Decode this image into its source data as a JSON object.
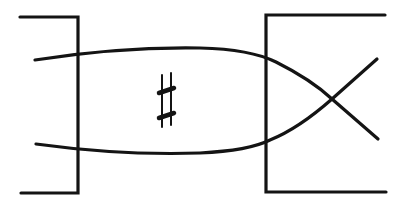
{
  "diagram": {
    "stroke_color": "#141414",
    "background": "#ffffff",
    "left_bracket": {
      "top_y": 17,
      "bottom_y": 193,
      "x": 78,
      "arm_start_x": 20
    },
    "right_bracket": {
      "top_y": 15,
      "bottom_y": 192,
      "x": 266,
      "arm_end_x": 386
    },
    "marker": {
      "symbol": "♯",
      "name": "sharp",
      "center": [
        166,
        100
      ]
    },
    "strands": [
      {
        "name": "upper-strand",
        "start": [
          35,
          60
        ],
        "end": [
          378,
          139
        ]
      },
      {
        "name": "lower-strand",
        "start": [
          36,
          144
        ],
        "end": [
          377,
          59
        ]
      }
    ],
    "crossing": {
      "point": [
        332,
        99
      ]
    }
  }
}
